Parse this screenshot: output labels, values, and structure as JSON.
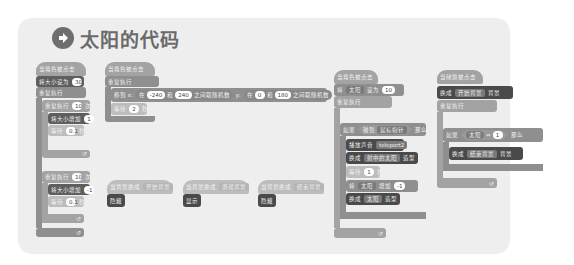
{
  "title": {
    "icon": "arrow-right-circle-icon",
    "text": "太阳的代码"
  },
  "colors": {
    "panel": "#eeeeee",
    "block_light": "#a3a3a3",
    "block_mid": "#8f8f8f",
    "block_dark": "#5e5e5e",
    "title": "#6a6a6a"
  },
  "scripts": {
    "s1": {
      "hat": "当角色被点击",
      "set_size": {
        "label": "将大小设为",
        "value": "30"
      },
      "forever": "重复执行",
      "repeat1": {
        "label": "重复执行",
        "value": "10",
        "suffix": "次"
      },
      "change1": {
        "label": "将大小增加",
        "value": "1"
      },
      "wait1": {
        "label": "等待",
        "value": "0.1",
        "suffix": "秒"
      },
      "repeat2": {
        "label": "重复执行",
        "value": "10",
        "suffix": "次"
      },
      "change2": {
        "label": "将大小增加",
        "value": "-1"
      },
      "wait2": {
        "label": "等待",
        "value": "0.1",
        "suffix": "秒"
      }
    },
    "s2": {
      "hat": "当角色被点击",
      "forever": "重复执行",
      "goto": {
        "label": "移到 x:",
        "rand1_prefix": "在",
        "x_min": "-240",
        "and1": "和",
        "x_max": "240",
        "rand1_suffix": "之间取随机数",
        "y_label": "y:",
        "rand2_prefix": "在",
        "y_min": "0",
        "and2": "和",
        "y_max": "180",
        "rand2_suffix": "之间取随机数"
      },
      "wait": {
        "label": "等待",
        "value": "2",
        "suffix": "秒"
      }
    },
    "s3": {
      "hat": "当背景换成",
      "dropdown": "开始背景",
      "action": "隐藏"
    },
    "s4": {
      "hat": "当背景换成",
      "dropdown": "游戏背景",
      "action": "显示"
    },
    "s5": {
      "hat": "当背景换成",
      "dropdown": "结束背景",
      "action": "隐藏"
    },
    "s6": {
      "hat": "当角色被点击",
      "set_var": {
        "label": "将",
        "var": "太阳",
        "mid": "设为",
        "value": "10"
      },
      "forever": "重复执行",
      "if": {
        "label": "如果",
        "cond": "碰到",
        "target": "鼠标指针",
        "suffix": "那么"
      },
      "sound": {
        "label": "播放声音",
        "value": "teleport2"
      },
      "costume1": {
        "label": "换成",
        "value": "射中的太阳",
        "suffix": "造型"
      },
      "wait": {
        "label": "等待",
        "value": "1",
        "suffix": "秒"
      },
      "change_var": {
        "label": "将",
        "var": "太阳",
        "mid": "增加",
        "value": "-1"
      },
      "costume2": {
        "label": "换成",
        "value": "太阳",
        "suffix": "造型"
      }
    },
    "s7": {
      "hat": "当绿旗被点击",
      "backdrop1": {
        "label": "换成",
        "value": "开始背景",
        "suffix": "背景"
      },
      "forever": "重复执行",
      "if": {
        "label": "如果",
        "var": "太阳",
        "op": "=",
        "value": "1",
        "suffix": "那么"
      },
      "backdrop2": {
        "label": "换成",
        "value": "结束背景",
        "suffix": "背景"
      }
    }
  }
}
